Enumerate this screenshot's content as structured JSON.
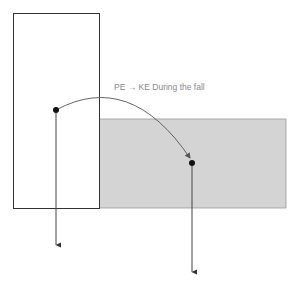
{
  "diagram": {
    "label": "PE → KE During the fall",
    "colors": {
      "outline": "#333333",
      "gray_region": "#d4d4d4",
      "label": "#8a8a8a",
      "arc": "#555555"
    },
    "shapes": {
      "tall_block": {
        "x": 13,
        "y": 13,
        "w": 86,
        "h": 195
      },
      "gray_block": {
        "x": 99,
        "y": 119,
        "w": 187,
        "h": 89
      },
      "start_point": {
        "x": 56,
        "y": 110
      },
      "end_point": {
        "x": 192,
        "y": 163
      },
      "arrow_1_end_y": 245,
      "arrow_2_end_y": 272
    }
  }
}
